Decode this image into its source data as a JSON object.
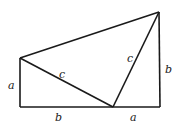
{
  "diagram": {
    "vertices": {
      "bottom_left": [
        20,
        107
      ],
      "top_left": [
        20,
        58
      ],
      "bottom_mid": [
        113,
        107
      ],
      "bottom_right": [
        160,
        107
      ],
      "top_right": [
        159,
        12
      ]
    },
    "labels": {
      "left_side": "a",
      "bottom_left_segment": "b",
      "bottom_right_segment": "a",
      "right_side": "b",
      "left_hypotenuse": "c",
      "right_hypotenuse": "c"
    },
    "stroke_color": "#1a1a1a"
  }
}
